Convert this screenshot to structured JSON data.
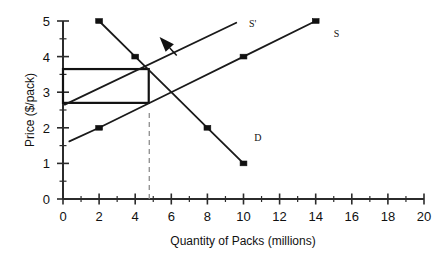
{
  "chart_data": {
    "type": "line",
    "title": "",
    "xlabel": "Quantity of Packs (millions)",
    "ylabel": "Price ($/pack)",
    "xlim": [
      0,
      20
    ],
    "ylim": [
      0,
      5
    ],
    "xticks": [
      0,
      2,
      4,
      6,
      8,
      10,
      12,
      14,
      16,
      18,
      20
    ],
    "xtick_labels": [
      "0",
      "2",
      "4",
      "6",
      "8",
      "10",
      "12",
      "14",
      "16",
      "18",
      "20"
    ],
    "xminor_step": 1,
    "yticks": [
      0,
      1,
      2,
      3,
      4,
      5
    ],
    "ytick_labels": [
      "0",
      "1",
      "2",
      "3",
      "4",
      "5"
    ],
    "yminor_step": 0.5,
    "grid": false,
    "legend_position": "inline-curve-labels",
    "series": [
      {
        "name": "D",
        "label": "D",
        "kind": "demand",
        "marker": "square",
        "x": [
          2,
          4,
          6,
          8,
          10
        ],
        "y": [
          5,
          4,
          3,
          2,
          1
        ],
        "marker_points": [
          {
            "x": 2,
            "y": 5
          },
          {
            "x": 4,
            "y": 4
          },
          {
            "x": 8,
            "y": 2
          },
          {
            "x": 10,
            "y": 1
          }
        ],
        "label_position": {
          "x": 10.6,
          "y": 1.62
        }
      },
      {
        "name": "S",
        "label": "S",
        "kind": "supply-original",
        "marker": "square",
        "x": [
          0.35,
          2,
          6,
          10,
          14
        ],
        "y": [
          1.62,
          2,
          3,
          4,
          5
        ],
        "marker_points": [
          {
            "x": 2,
            "y": 2
          },
          {
            "x": 10,
            "y": 4
          },
          {
            "x": 14,
            "y": 5
          }
        ],
        "label_position": {
          "x": 15.0,
          "y": 4.55
        }
      },
      {
        "name": "S'",
        "label": "S'",
        "kind": "supply-shifted",
        "marker": "none",
        "x": [
          0.1,
          9.6
        ],
        "y": [
          2.65,
          4.95
        ],
        "marker_points": [],
        "label_position": {
          "x": 10.3,
          "y": 4.82
        }
      }
    ],
    "annotations": [
      {
        "name": "shift-arrow",
        "type": "arrow",
        "from": {
          "x": 6.3,
          "y": 4.03
        },
        "to": {
          "x": 5.35,
          "y": 4.55
        },
        "description": "arrow showing supply curve shift left"
      },
      {
        "name": "tax-revenue-rectangle",
        "type": "rectangle",
        "x0": 0,
        "y0": 2.7,
        "x1": 4.75,
        "y1": 3.65,
        "description": "rectangle from price axis to equilibrium quantity between prices 2.70 and 3.65"
      },
      {
        "name": "equilibrium-dashed-line",
        "type": "dashed-vline",
        "x": 4.78,
        "y_from": 0,
        "y_to": 2.52,
        "description": "dashed vertical line at new equilibrium quantity"
      }
    ],
    "equilibria": [
      {
        "name": "new-equilibrium",
        "x": 4.78,
        "y": 3.62
      },
      {
        "name": "original-equilibrium",
        "x": 6.0,
        "y": 3.0
      }
    ]
  },
  "axes": {
    "x_title": "Quantity of Packs (millions)",
    "y_title": "Price ($/pack)"
  },
  "labels": {
    "supply_shifted": "S'",
    "supply": "S",
    "demand": "D"
  },
  "colors": {
    "ink": "#1a1a1a",
    "axis": "#3a3a3a",
    "dashed": "#8a8a8a",
    "background": "#ffffff"
  }
}
